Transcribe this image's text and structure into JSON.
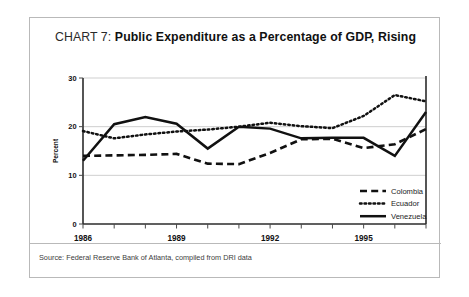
{
  "figure": {
    "title_prefix": "CHART 7: ",
    "title_main": "Public Expenditure as a Percentage of GDP, Rising",
    "source": "Source: Federal Reserve Bank of Atlanta, compiled from DRI data"
  },
  "chart_data": {
    "type": "line",
    "title": "CHART 7: Public Expenditure as a Percentage of GDP, Rising",
    "xlabel": "",
    "ylabel": "Percent",
    "ylim": [
      0,
      30
    ],
    "yticks": [
      0,
      10,
      20,
      30
    ],
    "ytick_labels": [
      "0",
      "10",
      "20",
      "30"
    ],
    "xlim": [
      1986,
      1997
    ],
    "xticks": [
      1986,
      1987,
      1988,
      1989,
      1990,
      1991,
      1992,
      1993,
      1994,
      1995,
      1996,
      1997
    ],
    "xtick_labels_shown": [
      "1986",
      "1989",
      "1992",
      "1995"
    ],
    "x": [
      1986,
      1987,
      1988,
      1989,
      1990,
      1991,
      1992,
      1993,
      1994,
      1995,
      1996,
      1997
    ],
    "grid": "horizontal",
    "legend_position": "inside-lower-right",
    "series": [
      {
        "name": "Colombia",
        "style": "dashed",
        "color": "#111111",
        "values": [
          14.0,
          14.1,
          14.2,
          14.4,
          12.4,
          12.3,
          14.6,
          17.4,
          17.5,
          15.6,
          16.4,
          19.5
        ]
      },
      {
        "name": "Ecuador",
        "style": "dotted",
        "color": "#111111",
        "values": [
          19.1,
          17.6,
          18.4,
          19.0,
          19.4,
          20.0,
          20.8,
          20.1,
          19.7,
          22.2,
          26.5,
          25.2
        ]
      },
      {
        "name": "Venezuela",
        "style": "solid",
        "color": "#111111",
        "values": [
          13.0,
          20.5,
          22.0,
          20.6,
          15.5,
          20.0,
          19.6,
          17.6,
          17.7,
          17.7,
          14.0,
          23.0
        ]
      }
    ]
  },
  "legend": {
    "items": [
      {
        "label": "Colombia",
        "style": "dashed"
      },
      {
        "label": "Ecuador",
        "style": "dotted"
      },
      {
        "label": "Venezuela",
        "style": "solid"
      }
    ]
  }
}
